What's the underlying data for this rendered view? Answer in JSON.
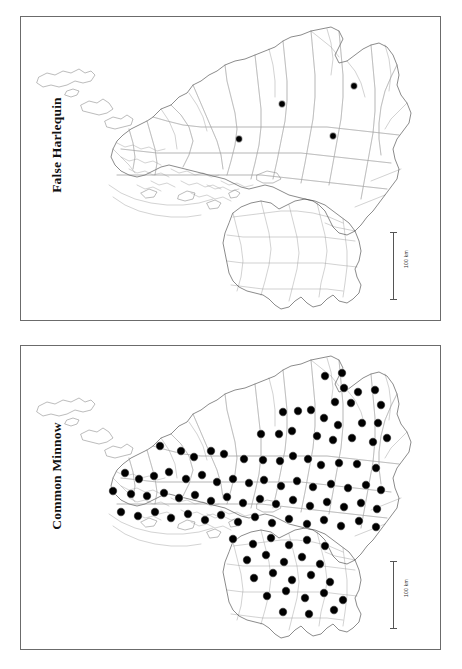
{
  "figure": {
    "kind": "species-distribution-map-pair",
    "panel_count": 2,
    "background_color": "#ffffff",
    "border_color": "#6b6b6b"
  },
  "panels": [
    {
      "id": "panel-top",
      "title": "False Harlequin",
      "title_orientation": "rotated-90-ccw",
      "record_count": 4,
      "scalebar": {
        "label": "100 km",
        "orientation": "vertical"
      },
      "dot_color": "#000000",
      "dot_radius": 3.4,
      "records": [
        {
          "x": 218,
          "y": 122
        },
        {
          "x": 261,
          "y": 87
        },
        {
          "x": 312,
          "y": 119
        },
        {
          "x": 333,
          "y": 69
        }
      ]
    },
    {
      "id": "panel-bottom",
      "title": "Common Minnow",
      "title_orientation": "rotated-90-ccw",
      "record_count": 112,
      "scalebar": {
        "label": "100 km",
        "orientation": "vertical"
      },
      "dot_color": "#000000",
      "dot_radius": 4.2,
      "records": [
        {
          "x": 304,
          "y": 30
        },
        {
          "x": 321,
          "y": 27
        },
        {
          "x": 323,
          "y": 42
        },
        {
          "x": 337,
          "y": 46
        },
        {
          "x": 354,
          "y": 44
        },
        {
          "x": 314,
          "y": 56
        },
        {
          "x": 330,
          "y": 57
        },
        {
          "x": 360,
          "y": 59
        },
        {
          "x": 262,
          "y": 66
        },
        {
          "x": 277,
          "y": 65
        },
        {
          "x": 290,
          "y": 64
        },
        {
          "x": 303,
          "y": 72
        },
        {
          "x": 317,
          "y": 79
        },
        {
          "x": 341,
          "y": 77
        },
        {
          "x": 357,
          "y": 77
        },
        {
          "x": 240,
          "y": 88
        },
        {
          "x": 258,
          "y": 88
        },
        {
          "x": 271,
          "y": 85
        },
        {
          "x": 296,
          "y": 90
        },
        {
          "x": 312,
          "y": 94
        },
        {
          "x": 331,
          "y": 92
        },
        {
          "x": 352,
          "y": 96
        },
        {
          "x": 366,
          "y": 92
        },
        {
          "x": 139,
          "y": 100
        },
        {
          "x": 160,
          "y": 105
        },
        {
          "x": 173,
          "y": 111
        },
        {
          "x": 190,
          "y": 105
        },
        {
          "x": 203,
          "y": 108
        },
        {
          "x": 223,
          "y": 113
        },
        {
          "x": 242,
          "y": 114
        },
        {
          "x": 259,
          "y": 115
        },
        {
          "x": 272,
          "y": 110
        },
        {
          "x": 287,
          "y": 113
        },
        {
          "x": 300,
          "y": 119
        },
        {
          "x": 318,
          "y": 117
        },
        {
          "x": 336,
          "y": 118
        },
        {
          "x": 355,
          "y": 122
        },
        {
          "x": 104,
          "y": 127
        },
        {
          "x": 118,
          "y": 133
        },
        {
          "x": 133,
          "y": 130
        },
        {
          "x": 148,
          "y": 126
        },
        {
          "x": 165,
          "y": 133
        },
        {
          "x": 181,
          "y": 129
        },
        {
          "x": 196,
          "y": 136
        },
        {
          "x": 212,
          "y": 133
        },
        {
          "x": 228,
          "y": 137
        },
        {
          "x": 243,
          "y": 134
        },
        {
          "x": 260,
          "y": 140
        },
        {
          "x": 276,
          "y": 135
        },
        {
          "x": 292,
          "y": 141
        },
        {
          "x": 310,
          "y": 138
        },
        {
          "x": 327,
          "y": 142
        },
        {
          "x": 345,
          "y": 139
        },
        {
          "x": 360,
          "y": 144
        },
        {
          "x": 92,
          "y": 145
        },
        {
          "x": 110,
          "y": 148
        },
        {
          "x": 126,
          "y": 150
        },
        {
          "x": 143,
          "y": 147
        },
        {
          "x": 158,
          "y": 152
        },
        {
          "x": 174,
          "y": 149
        },
        {
          "x": 190,
          "y": 155
        },
        {
          "x": 206,
          "y": 151
        },
        {
          "x": 222,
          "y": 157
        },
        {
          "x": 239,
          "y": 153
        },
        {
          "x": 255,
          "y": 158
        },
        {
          "x": 272,
          "y": 154
        },
        {
          "x": 289,
          "y": 160
        },
        {
          "x": 306,
          "y": 156
        },
        {
          "x": 323,
          "y": 161
        },
        {
          "x": 340,
          "y": 157
        },
        {
          "x": 356,
          "y": 163
        },
        {
          "x": 100,
          "y": 166
        },
        {
          "x": 117,
          "y": 170
        },
        {
          "x": 134,
          "y": 166
        },
        {
          "x": 150,
          "y": 172
        },
        {
          "x": 167,
          "y": 168
        },
        {
          "x": 184,
          "y": 174
        },
        {
          "x": 200,
          "y": 169
        },
        {
          "x": 217,
          "y": 176
        },
        {
          "x": 234,
          "y": 171
        },
        {
          "x": 251,
          "y": 177
        },
        {
          "x": 268,
          "y": 173
        },
        {
          "x": 286,
          "y": 178
        },
        {
          "x": 303,
          "y": 174
        },
        {
          "x": 320,
          "y": 180
        },
        {
          "x": 338,
          "y": 175
        },
        {
          "x": 355,
          "y": 181
        },
        {
          "x": 212,
          "y": 193
        },
        {
          "x": 232,
          "y": 198
        },
        {
          "x": 250,
          "y": 192
        },
        {
          "x": 268,
          "y": 199
        },
        {
          "x": 286,
          "y": 194
        },
        {
          "x": 304,
          "y": 200
        },
        {
          "x": 226,
          "y": 214
        },
        {
          "x": 245,
          "y": 209
        },
        {
          "x": 263,
          "y": 216
        },
        {
          "x": 281,
          "y": 211
        },
        {
          "x": 299,
          "y": 218
        },
        {
          "x": 233,
          "y": 232
        },
        {
          "x": 252,
          "y": 227
        },
        {
          "x": 271,
          "y": 234
        },
        {
          "x": 290,
          "y": 229
        },
        {
          "x": 309,
          "y": 236
        },
        {
          "x": 246,
          "y": 250
        },
        {
          "x": 265,
          "y": 245
        },
        {
          "x": 284,
          "y": 252
        },
        {
          "x": 303,
          "y": 247
        },
        {
          "x": 322,
          "y": 254
        },
        {
          "x": 262,
          "y": 266
        },
        {
          "x": 288,
          "y": 268
        },
        {
          "x": 313,
          "y": 264
        }
      ]
    }
  ]
}
